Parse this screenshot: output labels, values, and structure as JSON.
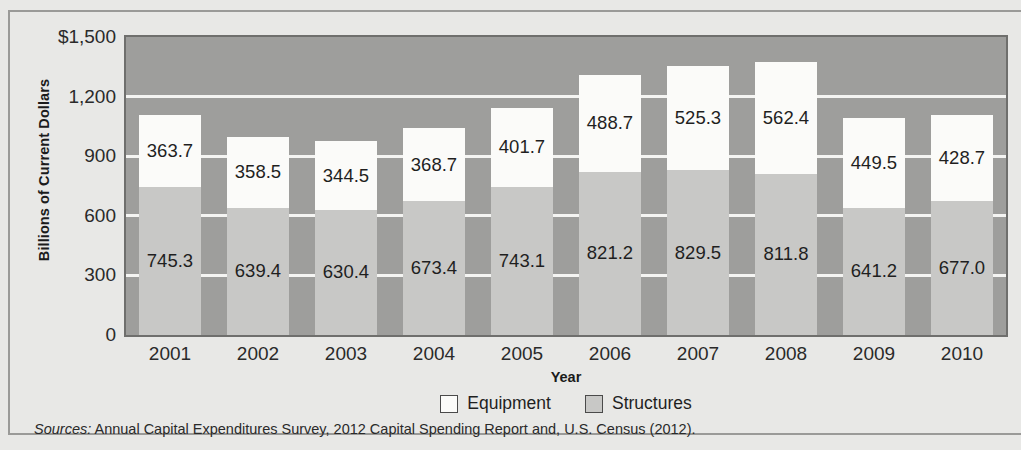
{
  "chart_data": {
    "type": "bar",
    "subtype": "stacked-bar",
    "title": "",
    "xlabel": "Year",
    "ylabel": "Billions of Current Dollars",
    "categories": [
      "2001",
      "2002",
      "2003",
      "2004",
      "2005",
      "2006",
      "2007",
      "2008",
      "2009",
      "2010"
    ],
    "series": [
      {
        "name": "Structures",
        "color": "#c8c8c6",
        "values": [
          745.3,
          639.4,
          630.4,
          673.4,
          743.1,
          821.2,
          829.5,
          811.8,
          641.2,
          677.0
        ]
      },
      {
        "name": "Equipment",
        "color": "#fbfbf9",
        "values": [
          363.7,
          358.5,
          344.5,
          368.7,
          401.7,
          488.7,
          525.3,
          562.4,
          449.5,
          428.7
        ]
      }
    ],
    "totals": [
      1109.0,
      997.9,
      974.9,
      1042.1,
      1144.8,
      1309.9,
      1354.8,
      1374.2,
      1090.7,
      1105.7
    ],
    "ylim": [
      0,
      1500
    ],
    "ytick_values": [
      0,
      300,
      600,
      900,
      1200,
      1500
    ],
    "ytick_labels": [
      "0",
      "300",
      "600",
      "900",
      "1,200",
      "$1,500"
    ],
    "grid": true,
    "gridline_values": [
      300,
      600,
      900,
      1200
    ],
    "legend_position": "bottom-center",
    "plot_background": "#9e9e9c",
    "gridline_color": "#f4f4f2"
  },
  "legend": {
    "items": [
      {
        "label": "Equipment",
        "swatch": "#fbfbf9"
      },
      {
        "label": "Structures",
        "swatch": "#c8c8c6"
      }
    ]
  },
  "axes": {
    "y_title": "Billions of Current Dollars",
    "x_title": "Year"
  },
  "source": {
    "lead": "Sources:",
    "text": " Annual Capital Expenditures Survey, 2012 Capital Spending Report and, U.S. Census (2012)."
  }
}
